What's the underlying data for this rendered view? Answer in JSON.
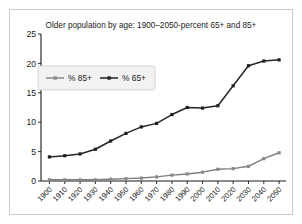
{
  "chart_data": {
    "type": "line",
    "title": "Older population by age: 1900–2050-percent 65+ and 85+",
    "xlabel": "",
    "ylabel": "",
    "categories": [
      "1900",
      "1910",
      "1920",
      "1930",
      "1940",
      "1950",
      "1960",
      "1970",
      "1980",
      "1990",
      "2000",
      "2010",
      "2020",
      "2030",
      "2040",
      "2050"
    ],
    "series": [
      {
        "name": "% 85+",
        "color": "#8a8a8a",
        "values": [
          0.2,
          0.2,
          0.2,
          0.2,
          0.3,
          0.4,
          0.5,
          0.7,
          1.0,
          1.2,
          1.5,
          2.0,
          2.1,
          2.5,
          3.8,
          4.8
        ]
      },
      {
        "name": "% 65+",
        "color": "#1f1f1f",
        "values": [
          4.1,
          4.3,
          4.6,
          5.4,
          6.8,
          8.1,
          9.2,
          9.8,
          11.3,
          12.5,
          12.4,
          12.8,
          16.2,
          19.6,
          20.4,
          20.6
        ]
      }
    ],
    "ylim": [
      0,
      25
    ],
    "yticks": [
      0,
      5,
      10,
      15,
      20,
      25
    ],
    "grid": false,
    "legend_position": "upper-left",
    "legend_entries": [
      "% 85+",
      "% 65+"
    ]
  },
  "figure": {
    "frame_color": "#c9c9c9",
    "background": "#ffffff"
  }
}
